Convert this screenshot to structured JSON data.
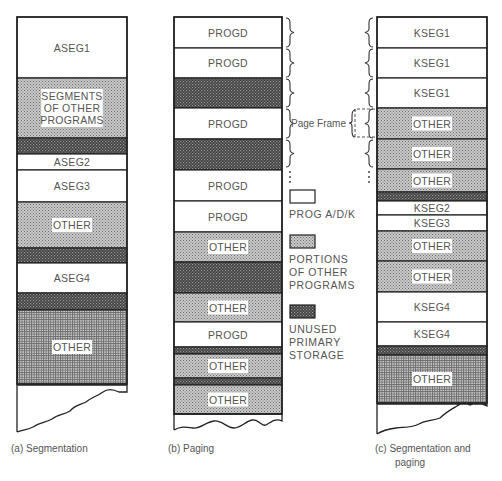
{
  "figure": {
    "columns": [
      {
        "id": "a",
        "caption_lines": [
          "(a)  Segmentation"
        ],
        "blocks": [
          {
            "type": "prog",
            "label": [
              "ASEG1"
            ],
            "units": 61
          },
          {
            "type": "other",
            "label": [
              "SEGMENTS",
              "OF OTHER",
              "PROGRAMS"
            ],
            "units": 60
          },
          {
            "type": "unused",
            "label": [],
            "units": 16
          },
          {
            "type": "prog",
            "label": [
              "ASEG2"
            ],
            "units": 16
          },
          {
            "type": "prog",
            "label": [
              "ASEG3"
            ],
            "units": 32
          },
          {
            "type": "other",
            "label": [
              "OTHER"
            ],
            "units": 46
          },
          {
            "type": "unused",
            "label": [],
            "units": 15
          },
          {
            "type": "prog",
            "label": [
              "ASEG4"
            ],
            "units": 30
          },
          {
            "type": "unused",
            "label": [],
            "units": 17
          },
          {
            "type": "other-grid",
            "label": [
              "OTHER"
            ],
            "units": 74
          }
        ]
      },
      {
        "id": "b",
        "caption_lines": [
          "(b)  Paging"
        ],
        "blocks": [
          {
            "type": "prog",
            "label": [
              "PROGD"
            ],
            "units": 31
          },
          {
            "type": "prog",
            "label": [
              "PROGD"
            ],
            "units": 30
          },
          {
            "type": "unused",
            "label": [],
            "units": 30
          },
          {
            "type": "prog",
            "label": [
              "PROGD"
            ],
            "units": 31
          },
          {
            "type": "unused",
            "label": [],
            "units": 31
          },
          {
            "type": "prog",
            "label": [
              "PROGD"
            ],
            "units": 31
          },
          {
            "type": "prog",
            "label": [
              "PROGD"
            ],
            "units": 31
          },
          {
            "type": "other",
            "label": [
              "OTHER"
            ],
            "units": 30
          },
          {
            "type": "unused",
            "label": [],
            "units": 31
          },
          {
            "type": "other",
            "label": [
              "OTHER"
            ],
            "units": 29
          },
          {
            "type": "prog",
            "label": [
              "PROGD"
            ],
            "units": 25
          },
          {
            "type": "unused",
            "label": [],
            "units": 7
          },
          {
            "type": "other",
            "label": [
              "OTHER"
            ],
            "units": 24
          },
          {
            "type": "unused",
            "label": [],
            "units": 7
          },
          {
            "type": "other",
            "label": [
              "OTHER"
            ],
            "units": 29
          }
        ]
      },
      {
        "id": "c",
        "caption_lines": [
          "(c)  Segmentation and",
          "paging"
        ],
        "blocks": [
          {
            "type": "prog",
            "label": [
              "KSEG1"
            ],
            "units": 31
          },
          {
            "type": "prog",
            "label": [
              "KSEG1"
            ],
            "units": 30
          },
          {
            "type": "prog",
            "label": [
              "KSEG1"
            ],
            "units": 30
          },
          {
            "type": "other",
            "label": [
              "OTHER"
            ],
            "units": 31
          },
          {
            "type": "other",
            "label": [
              "OTHER"
            ],
            "units": 30
          },
          {
            "type": "other",
            "label": [
              "OTHER"
            ],
            "units": 23
          },
          {
            "type": "unused",
            "label": [],
            "units": 9
          },
          {
            "type": "prog",
            "label": [
              "KSEG2"
            ],
            "units": 14
          },
          {
            "type": "prog",
            "label": [
              "KSEG3"
            ],
            "units": 16
          },
          {
            "type": "other",
            "label": [
              "OTHER"
            ],
            "units": 30
          },
          {
            "type": "other",
            "label": [
              "OTHER"
            ],
            "units": 31
          },
          {
            "type": "prog",
            "label": [
              "KSEG4"
            ],
            "units": 30
          },
          {
            "type": "prog",
            "label": [
              "KSEG4"
            ],
            "units": 24
          },
          {
            "type": "unused",
            "label": [],
            "units": 9
          },
          {
            "type": "other-grid",
            "label": [
              "OTHER"
            ],
            "units": 48
          }
        ]
      }
    ],
    "page_frame_label": "Page Frame",
    "legend": [
      {
        "type": "prog",
        "lines": [
          "PROG A/D/K"
        ]
      },
      {
        "type": "other",
        "lines": [
          "PORTIONS",
          "OF OTHER",
          "PROGRAMS"
        ]
      },
      {
        "type": "unused",
        "lines": [
          "UNUSED",
          "PRIMARY",
          "STORAGE"
        ]
      }
    ]
  }
}
